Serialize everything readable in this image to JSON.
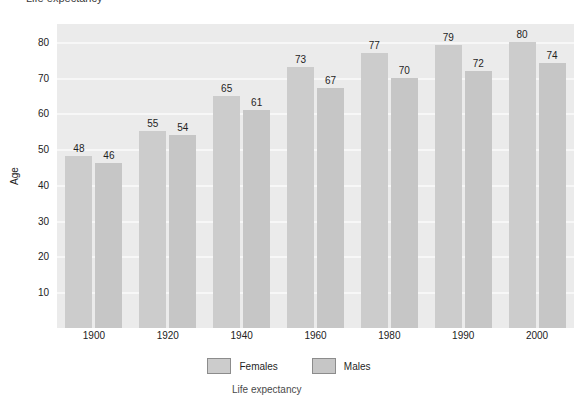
{
  "chart_data": {
    "type": "bar",
    "title": "Life expectancy",
    "caption": "Life expectancy",
    "xlabel": "",
    "ylabel": "Age",
    "ylim": [
      0,
      85
    ],
    "y_ticks": [
      10,
      20,
      30,
      40,
      50,
      60,
      70,
      80
    ],
    "grid": true,
    "legend_position": "bottom",
    "categories": [
      "1900",
      "1920",
      "1940",
      "1960",
      "1980",
      "1990",
      "2000"
    ],
    "series": [
      {
        "name": "Females",
        "color": "#cccccc",
        "values": [
          48,
          55,
          65,
          73,
          77,
          79,
          80
        ]
      },
      {
        "name": "Males",
        "color": "#c6c6c6",
        "values": [
          46,
          54,
          61,
          67,
          70,
          72,
          74
        ]
      }
    ]
  },
  "plot": {
    "background_color": "#ebebeb",
    "gridline_color": "#f7f7f7"
  }
}
